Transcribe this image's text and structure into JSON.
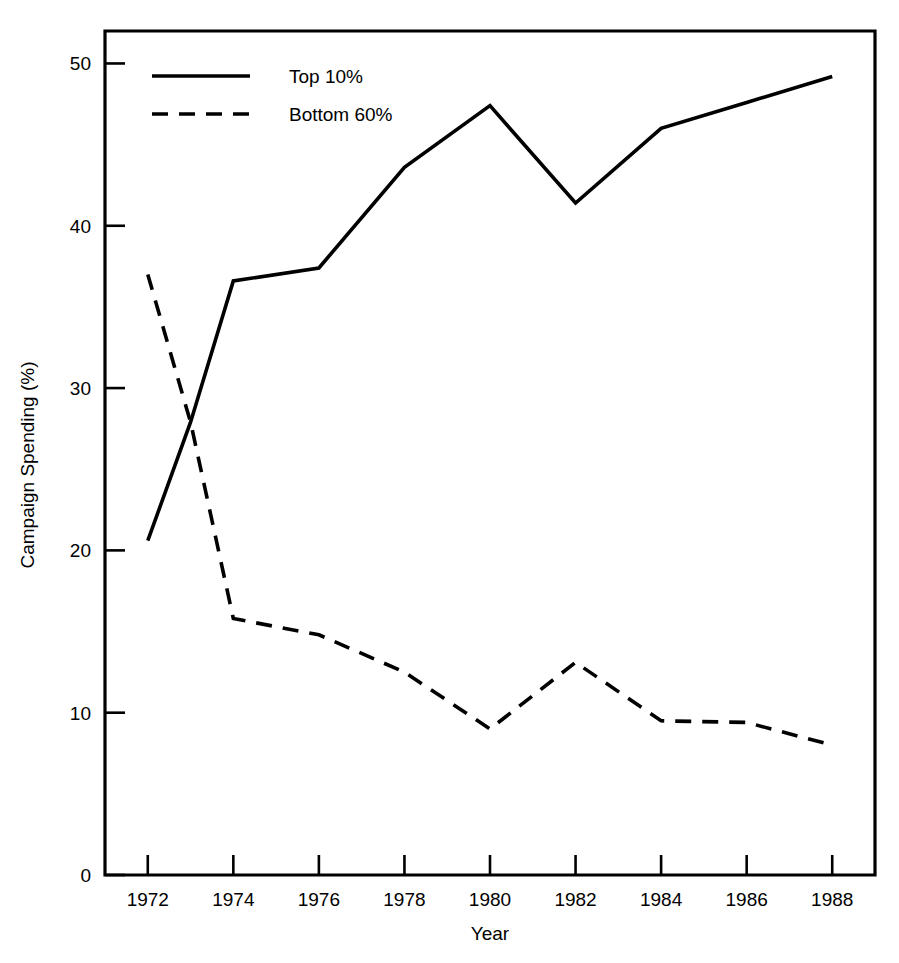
{
  "chart_data": {
    "type": "line",
    "title": "",
    "xlabel": "Year",
    "ylabel": "Campaign Spending (%)",
    "x": [
      1972,
      1973,
      1974,
      1976,
      1978,
      1980,
      1982,
      1984,
      1986,
      1988
    ],
    "xlim": [
      1971,
      1989
    ],
    "ylim": [
      0,
      52
    ],
    "xticks": [
      1972,
      1974,
      1976,
      1978,
      1980,
      1982,
      1984,
      1986,
      1988
    ],
    "xtick_labels": [
      "1972",
      "1974",
      "1976",
      "1978",
      "1980",
      "1982",
      "1984",
      "1986",
      "1988"
    ],
    "yticks": [
      0,
      10,
      20,
      30,
      40,
      50
    ],
    "ytick_labels": [
      "0",
      "10",
      "20",
      "30",
      "40",
      "50"
    ],
    "grid": false,
    "legend_position": "upper-left-inside",
    "series": [
      {
        "name": "Top 10%",
        "style": "solid",
        "color": "#000000",
        "points": [
          {
            "x": 1972,
            "y": 20.6
          },
          {
            "x": 1973,
            "y": 27.9
          },
          {
            "x": 1974,
            "y": 36.6
          },
          {
            "x": 1976,
            "y": 37.4
          },
          {
            "x": 1978,
            "y": 43.6
          },
          {
            "x": 1980,
            "y": 47.4
          },
          {
            "x": 1982,
            "y": 41.4
          },
          {
            "x": 1984,
            "y": 46.0
          },
          {
            "x": 1986,
            "y": 47.6
          },
          {
            "x": 1988,
            "y": 49.2
          }
        ]
      },
      {
        "name": "Bottom 60%",
        "style": "dashed",
        "color": "#000000",
        "points": [
          {
            "x": 1972,
            "y": 37.0
          },
          {
            "x": 1973,
            "y": 27.9
          },
          {
            "x": 1974,
            "y": 15.8
          },
          {
            "x": 1976,
            "y": 14.8
          },
          {
            "x": 1978,
            "y": 12.5
          },
          {
            "x": 1980,
            "y": 9.0
          },
          {
            "x": 1982,
            "y": 13.1
          },
          {
            "x": 1984,
            "y": 9.5
          },
          {
            "x": 1986,
            "y": 9.4
          },
          {
            "x": 1988,
            "y": 8.0
          }
        ]
      }
    ],
    "legend": [
      {
        "label": "Top 10%",
        "style": "solid"
      },
      {
        "label": "Bottom 60%",
        "style": "dashed"
      }
    ]
  },
  "axes": {
    "x_title": "Year",
    "y_title": "Campaign Spending (%)"
  }
}
